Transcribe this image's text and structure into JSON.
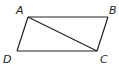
{
  "figure": {
    "type": "parallelogram",
    "vertices": [
      {
        "name": "A",
        "label": "A",
        "x": 28,
        "y": 17,
        "lx": 16,
        "ly": 14
      },
      {
        "name": "B",
        "label": "B",
        "x": 108,
        "y": 17,
        "lx": 109,
        "ly": 14
      },
      {
        "name": "C",
        "label": "C",
        "x": 97,
        "y": 51,
        "lx": 100,
        "ly": 63
      },
      {
        "name": "D",
        "label": "D",
        "x": 17,
        "y": 51,
        "lx": 3,
        "ly": 63
      }
    ],
    "edges": [
      [
        "A",
        "B"
      ],
      [
        "B",
        "C"
      ],
      [
        "C",
        "D"
      ],
      [
        "D",
        "A"
      ]
    ],
    "diagonals": [
      [
        "A",
        "C"
      ]
    ],
    "line_color": "#222222"
  }
}
